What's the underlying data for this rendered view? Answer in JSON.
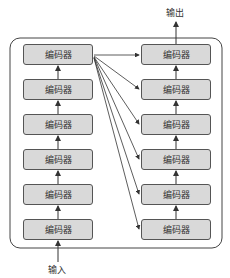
{
  "diagram": {
    "output_label": "输出",
    "input_label": "输入",
    "left_column": [
      {
        "label": "编码器"
      },
      {
        "label": "编码器"
      },
      {
        "label": "编码器"
      },
      {
        "label": "编码器"
      },
      {
        "label": "编码器"
      },
      {
        "label": "编码器"
      }
    ],
    "right_column": [
      {
        "label": "编码器"
      },
      {
        "label": "编码器"
      },
      {
        "label": "编码器"
      },
      {
        "label": "编码器"
      },
      {
        "label": "编码器"
      },
      {
        "label": "编码器"
      }
    ]
  }
}
